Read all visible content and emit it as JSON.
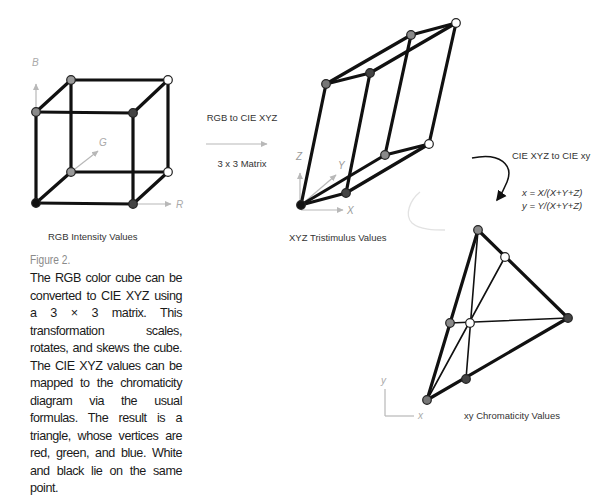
{
  "figure": {
    "label": "Figure 2.",
    "caption": "The RGB color cube can be con­verted to CIE XYZ using a 3 × 3 matrix. This transformation scales, rotates, and skews the cube. The CIE XYZ values can be mapped to the chromaticity diagram via the usual formulas. The result is a triangle, whose vertices are red, green, and blue. White and black lie on the same point."
  },
  "panels": {
    "rgb": {
      "title": "RGB Intensity Values",
      "axes": {
        "r": "R",
        "g": "G",
        "b": "B"
      }
    },
    "xyz": {
      "title": "XYZ Tristimulus Values",
      "axes": {
        "x": "X",
        "y": "Y",
        "z": "Z"
      }
    },
    "xy": {
      "title": "xy Chromaticity Values",
      "axes": {
        "x": "x",
        "y": "y"
      }
    }
  },
  "transforms": {
    "rgb_to_xyz": {
      "title": "RGB to CIE XYZ",
      "subtitle": "3 x 3 Matrix"
    },
    "xyz_to_xy": {
      "title": "CIE XYZ to CIE xy",
      "formula_x": "x = X/(X+Y+Z)",
      "formula_y": "y = Y/(X+Y+Z)"
    }
  },
  "colors": {
    "black_vertex": "#111111",
    "dark_vertex": "#444444",
    "gray_vertex": "#8a8a8a",
    "white_vertex": "#ffffff",
    "edge": "#111111",
    "axis": "#b8b8b8",
    "caption_label": "#8a8a8a"
  }
}
